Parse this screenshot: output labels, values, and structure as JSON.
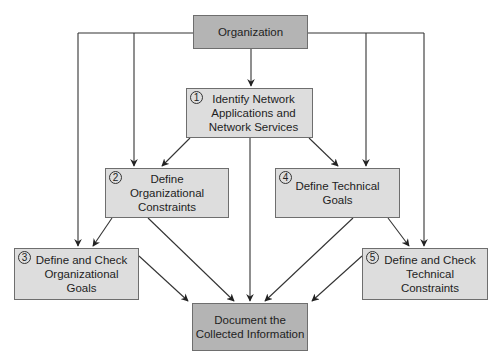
{
  "diagram": {
    "nodes": {
      "organization": {
        "label": "Organization"
      },
      "identify": {
        "step": "1",
        "label": "Identify Network\nApplications and\nNetwork Services"
      },
      "org_constraints": {
        "step": "2",
        "label": "Define\nOrganizational\nConstraints"
      },
      "org_goals": {
        "step": "3",
        "label": "Define and Check\nOrganizational\nGoals"
      },
      "tech_goals": {
        "step": "4",
        "label": "Define Technical\nGoals"
      },
      "tech_constraints": {
        "step": "5",
        "label": "Define and Check\nTechnical\nConstraints"
      },
      "document": {
        "label": "Document the\nCollected Information"
      }
    },
    "edges": [
      {
        "from": "organization",
        "to": "identify"
      },
      {
        "from": "organization",
        "to": "org_constraints"
      },
      {
        "from": "organization",
        "to": "org_goals"
      },
      {
        "from": "organization",
        "to": "tech_goals"
      },
      {
        "from": "organization",
        "to": "tech_constraints"
      },
      {
        "from": "identify",
        "to": "org_constraints"
      },
      {
        "from": "identify",
        "to": "tech_goals"
      },
      {
        "from": "identify",
        "to": "document"
      },
      {
        "from": "org_constraints",
        "to": "org_goals"
      },
      {
        "from": "org_constraints",
        "to": "document"
      },
      {
        "from": "tech_goals",
        "to": "tech_constraints"
      },
      {
        "from": "tech_goals",
        "to": "document"
      },
      {
        "from": "org_goals",
        "to": "document"
      },
      {
        "from": "tech_constraints",
        "to": "document"
      }
    ],
    "colors": {
      "primary_box": "#b4b4b4",
      "step_box": "#dddddd",
      "border": "#6e6e6e",
      "line": "#222222"
    }
  }
}
